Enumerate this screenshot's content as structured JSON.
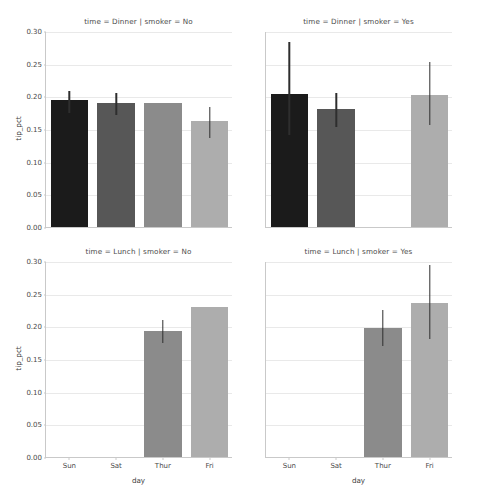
{
  "chart_data": {
    "type": "bar",
    "title": "",
    "xlabel": "day",
    "ylabel": "tip_pct",
    "categories": [
      "Sun",
      "Sat",
      "Thur",
      "Fri"
    ],
    "ylim": [
      0.0,
      0.3
    ],
    "yticks": [
      "0.00",
      "0.05",
      "0.10",
      "0.15",
      "0.20",
      "0.25",
      "0.30"
    ],
    "ytick_values": [
      0.0,
      0.05,
      0.1,
      0.15,
      0.2,
      0.25,
      0.3
    ],
    "grid": true,
    "legend": "none",
    "facet_rows": [
      "Dinner",
      "Lunch"
    ],
    "facet_cols": [
      "No",
      "Yes"
    ],
    "facet_row_var": "time",
    "facet_col_var": "smoker",
    "bar_colors": [
      "#1b1b1b",
      "#575757",
      "#8b8b8b",
      "#adadad"
    ],
    "errorbar_color": "#2e2e2e",
    "panels": [
      {
        "id": "dinner-no",
        "title": "time = Dinner | smoker = No",
        "row": 0,
        "col": 0,
        "bars": [
          {
            "category": "Sun",
            "value": 0.194,
            "ci_low": 0.176,
            "ci_high": 0.209,
            "color": "#1b1b1b"
          },
          {
            "category": "Sat",
            "value": 0.19,
            "ci_low": 0.173,
            "ci_high": 0.207,
            "color": "#575757"
          },
          {
            "category": "Thur",
            "value": 0.19,
            "ci_low": null,
            "ci_high": null,
            "color": "#8b8b8b"
          },
          {
            "category": "Fri",
            "value": 0.162,
            "ci_low": 0.137,
            "ci_high": 0.185,
            "color": "#adadad"
          }
        ]
      },
      {
        "id": "dinner-yes",
        "title": "time = Dinner | smoker = Yes",
        "row": 0,
        "col": 1,
        "bars": [
          {
            "category": "Sun",
            "value": 0.203,
            "ci_low": 0.143,
            "ci_high": 0.284,
            "color": "#1b1b1b"
          },
          {
            "category": "Sat",
            "value": 0.18,
            "ci_low": 0.155,
            "ci_high": 0.207,
            "color": "#575757"
          },
          {
            "category": "Thur",
            "value": null,
            "ci_low": null,
            "ci_high": null,
            "color": "#8b8b8b"
          },
          {
            "category": "Fri",
            "value": 0.202,
            "ci_low": 0.157,
            "ci_high": 0.254,
            "color": "#adadad"
          }
        ]
      },
      {
        "id": "lunch-no",
        "title": "time = Lunch | smoker = No",
        "row": 1,
        "col": 0,
        "bars": [
          {
            "category": "Sun",
            "value": null,
            "ci_low": null,
            "ci_high": null,
            "color": "#1b1b1b"
          },
          {
            "category": "Sat",
            "value": null,
            "ci_low": null,
            "ci_high": null,
            "color": "#575757"
          },
          {
            "category": "Thur",
            "value": 0.193,
            "ci_low": 0.176,
            "ci_high": 0.211,
            "color": "#8b8b8b"
          },
          {
            "category": "Fri",
            "value": 0.229,
            "ci_low": null,
            "ci_high": null,
            "color": "#adadad"
          }
        ]
      },
      {
        "id": "lunch-yes",
        "title": "time = Lunch | smoker = Yes",
        "row": 1,
        "col": 1,
        "bars": [
          {
            "category": "Sun",
            "value": null,
            "ci_low": null,
            "ci_high": null,
            "color": "#1b1b1b"
          },
          {
            "category": "Sat",
            "value": null,
            "ci_low": null,
            "ci_high": null,
            "color": "#575757"
          },
          {
            "category": "Thur",
            "value": 0.198,
            "ci_low": 0.171,
            "ci_high": 0.226,
            "color": "#8b8b8b"
          },
          {
            "category": "Fri",
            "value": 0.236,
            "ci_low": 0.182,
            "ci_high": 0.295,
            "color": "#adadad"
          }
        ]
      }
    ]
  },
  "footer": {
    "note": ""
  }
}
